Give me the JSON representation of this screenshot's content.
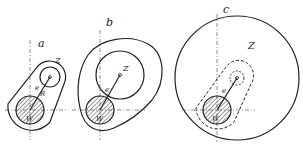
{
  "figure": {
    "panels": [
      {
        "id": "a",
        "label": "a",
        "labels": {
          "z": "Z",
          "e": "e",
          "r": "R",
          "w": "W"
        }
      },
      {
        "id": "b",
        "label": "b",
        "labels": {
          "z": "Z",
          "e": "e",
          "w": "W"
        }
      },
      {
        "id": "c",
        "label": "c",
        "labels": {
          "z": "Z",
          "e": "e",
          "w": "W"
        }
      }
    ]
  },
  "colors": {
    "ink": "#222222",
    "background": "#ffffff"
  }
}
